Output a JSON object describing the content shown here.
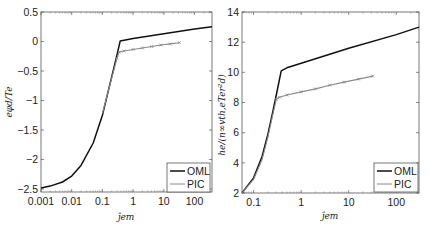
{
  "chart_data": [
    {
      "type": "line",
      "panel": "left",
      "title": "",
      "xlabel": "j_em",
      "ylabel": "e φ_d / T_e",
      "xscale": "log",
      "xlim": [
        0.001,
        370
      ],
      "ylim": [
        -2.55,
        0.5
      ],
      "grid": false,
      "legend_position": "lower right",
      "xticks": [
        0.001,
        0.01,
        0.1,
        1,
        10,
        100
      ],
      "xtick_labels": [
        "0.001",
        "0.01",
        "0.1",
        "1",
        "10",
        "100"
      ],
      "yticks": [
        0.5,
        0,
        -0.5,
        -1,
        -1.5,
        -2,
        -2.5
      ],
      "ytick_labels": [
        "0.5",
        "0",
        "-0.5",
        "-1",
        "-1.5",
        "-2",
        "-2.5"
      ],
      "series": [
        {
          "name": "OML",
          "color": "#111111",
          "marker": "none",
          "x": [
            0.001,
            0.002,
            0.005,
            0.01,
            0.02,
            0.05,
            0.1,
            0.2,
            0.3,
            0.38,
            1,
            10,
            100,
            370
          ],
          "y": [
            -2.48,
            -2.45,
            -2.38,
            -2.28,
            -2.1,
            -1.72,
            -1.25,
            -0.6,
            -0.22,
            0.01,
            0.05,
            0.13,
            0.21,
            0.25
          ]
        },
        {
          "name": "PIC",
          "color": "#8a8a8a",
          "marker": "x",
          "x": [
            0.1,
            0.2,
            0.3,
            0.35,
            0.5,
            1,
            2,
            4,
            8,
            16,
            32
          ],
          "y": [
            -1.22,
            -0.62,
            -0.28,
            -0.18,
            -0.16,
            -0.135,
            -0.11,
            -0.085,
            -0.06,
            -0.04,
            -0.02
          ]
        }
      ]
    },
    {
      "type": "line",
      "panel": "right",
      "title": "",
      "xlabel": "j_em",
      "ylabel": "h_e / (n_∞ v_th,e T_e r_d²)",
      "xscale": "log",
      "xlim": [
        0.057,
        300
      ],
      "ylim": [
        2,
        14
      ],
      "grid": false,
      "legend_position": "lower right",
      "xticks": [
        0.1,
        1,
        10,
        100
      ],
      "xtick_labels": [
        "0.1",
        "1",
        "10",
        "100"
      ],
      "yticks": [
        14,
        12,
        10,
        8,
        6,
        4,
        2
      ],
      "ytick_labels": [
        "14",
        "12",
        "10",
        "8",
        "6",
        "4",
        "2"
      ],
      "series": [
        {
          "name": "OML",
          "color": "#111111",
          "marker": "none",
          "x": [
            0.057,
            0.1,
            0.15,
            0.2,
            0.25,
            0.3,
            0.38,
            0.5,
            1,
            10,
            100,
            300
          ],
          "y": [
            2.0,
            3.0,
            4.4,
            5.9,
            7.3,
            8.5,
            10.1,
            10.3,
            10.6,
            11.6,
            12.5,
            13.0
          ]
        },
        {
          "name": "PIC",
          "color": "#8a8a8a",
          "marker": "x",
          "x": [
            0.057,
            0.1,
            0.15,
            0.2,
            0.25,
            0.3,
            0.35,
            0.5,
            1,
            2,
            4,
            8,
            16,
            32
          ],
          "y": [
            2.0,
            2.9,
            4.2,
            5.7,
            7.1,
            8.2,
            8.35,
            8.5,
            8.7,
            8.9,
            9.15,
            9.35,
            9.55,
            9.75
          ]
        }
      ]
    }
  ],
  "panels": {
    "left": {
      "ylabel": "eφd/Te",
      "xlabel": "ĵem",
      "legend": {
        "oml": "OML",
        "pic": "PIC"
      }
    },
    "right": {
      "ylabel": "he/(n∞vth,eTer²d)",
      "xlabel": "ĵem",
      "legend": {
        "oml": "OML",
        "pic": "PIC"
      }
    }
  }
}
